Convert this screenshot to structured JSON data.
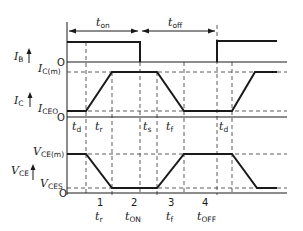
{
  "diagram": {
    "type": "switching-waveforms",
    "timing_labels": {
      "t_on": {
        "main": "t",
        "sub": "on"
      },
      "t_off": {
        "main": "t",
        "sub": "off"
      }
    },
    "traces": [
      {
        "id": "ib",
        "label_main": "I",
        "label_sub": "B",
        "levels": [
          {
            "main": "O",
            "sub": ""
          }
        ]
      },
      {
        "id": "ic",
        "label_main": "I",
        "label_sub": "C",
        "levels": [
          {
            "main": "I",
            "sub": "C(m)"
          },
          {
            "main": "I",
            "sub": "CEO"
          },
          {
            "main": "O",
            "sub": ""
          }
        ]
      },
      {
        "id": "vce",
        "label_main": "V",
        "label_sub": "CE",
        "levels": [
          {
            "main": "V",
            "sub": "CE(m)"
          },
          {
            "main": "V",
            "sub": "CES"
          },
          {
            "main": "O",
            "sub": ""
          }
        ]
      }
    ],
    "ic_interval_labels": [
      {
        "main": "t",
        "sub": "d"
      },
      {
        "main": "t",
        "sub": "r"
      },
      {
        "main": "t",
        "sub": "s"
      },
      {
        "main": "t",
        "sub": "f"
      },
      {
        "main": "t",
        "sub": "d"
      }
    ],
    "region_numbers": [
      "1",
      "2",
      "3",
      "4"
    ],
    "bottom_labels": [
      {
        "main": "t",
        "sub": "r"
      },
      {
        "main": "t",
        "sub": "ON"
      },
      {
        "main": "t",
        "sub": "f"
      },
      {
        "main": "t",
        "sub": "OFF"
      }
    ]
  }
}
